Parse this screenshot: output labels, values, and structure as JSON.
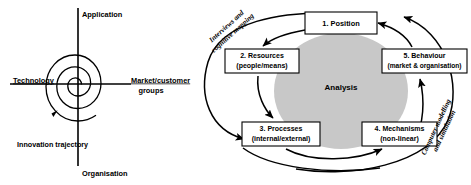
{
  "figure": {
    "left_diagram": {
      "name": "innovation-trajectory-spiral",
      "axis_labels": {
        "top": "Application",
        "left": "Technology",
        "right_line1": "Market/customer",
        "right_line2": "groups",
        "bottom": "Organisation"
      },
      "annotation": "Innovation trajectory"
    },
    "right_diagram": {
      "name": "analysis-cycle-diagram",
      "center_label": "Analysis",
      "boxes": [
        {
          "id": "position",
          "line1": "1. Position",
          "line2": ""
        },
        {
          "id": "resources",
          "line1": "2. Resources",
          "line2": "(people/means)"
        },
        {
          "id": "behaviour",
          "line1": "5. Behaviour",
          "line2": "(market & organisation)"
        },
        {
          "id": "processes",
          "line1": "3. Processes",
          "line2": "(internal/external)"
        },
        {
          "id": "mechanisms",
          "line1": "4. Mechanisms",
          "line2": "(non-linear)"
        }
      ],
      "curve_labels": {
        "left_line1": "Interviews and",
        "left_line2": "cognitive mapping",
        "right_line1": "Computer modelling",
        "right_line2": "and simulation"
      }
    },
    "colors": {
      "stroke": "#000000",
      "ellipse_fill": "#c8c8c8",
      "background": "#ffffff"
    }
  }
}
